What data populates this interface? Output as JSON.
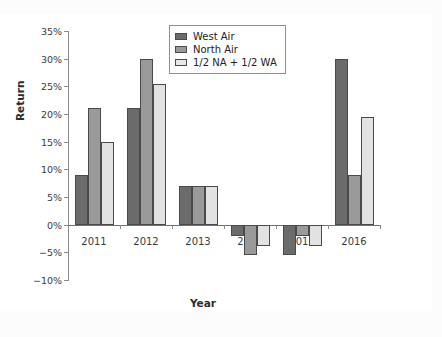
{
  "chart_data": {
    "type": "bar",
    "title": "",
    "xlabel": "Year",
    "ylabel": "Return",
    "categories": [
      "2011",
      "2012",
      "2013",
      "2014",
      "2015",
      "2016"
    ],
    "ytick_labels": [
      "35%",
      "30%",
      "25%",
      "20%",
      "15%",
      "10%",
      "5%",
      "0%",
      "−5%",
      "−10%"
    ],
    "ytick_values": [
      35,
      30,
      25,
      20,
      15,
      10,
      5,
      0,
      -5,
      -10
    ],
    "ylim": [
      -10,
      35
    ],
    "yunit": "%",
    "grid": false,
    "legend_position": "top-center",
    "series": [
      {
        "name": "West Air",
        "color": "#6b6b6b",
        "values": [
          9,
          21,
          7,
          -2,
          -5.5,
          30
        ]
      },
      {
        "name": "North Air",
        "color": "#9a9a9a",
        "values": [
          21,
          30,
          7,
          -5.5,
          -2,
          9
        ]
      },
      {
        "name": "1/2 NA + 1/2 WA",
        "color": "#e2e2e2",
        "values": [
          15,
          25.5,
          7,
          -3.8,
          -3.8,
          19.5
        ]
      }
    ]
  }
}
